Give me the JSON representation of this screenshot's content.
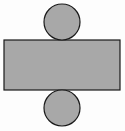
{
  "diagram": {
    "type": "cylinder-net",
    "fill_color": "#a8a8a8",
    "stroke_color": "#1a1a1a",
    "background": "#fdfdfd",
    "shapes": {
      "top_circle": {
        "cx": 62,
        "cy": 22,
        "r": 18
      },
      "rectangle": {
        "x": 4,
        "y": 40,
        "width": 116,
        "height": 50
      },
      "bottom_circle": {
        "cx": 62,
        "cy": 108,
        "r": 18
      }
    }
  }
}
